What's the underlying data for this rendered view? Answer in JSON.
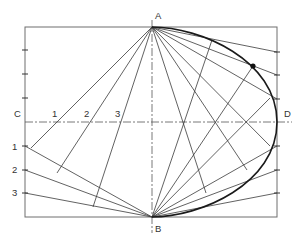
{
  "diagram": {
    "frame": {
      "x": 25,
      "y": 27,
      "width": 252,
      "height": 190
    },
    "center": {
      "x": 152,
      "y": 122
    },
    "labels": {
      "A": {
        "text": "A",
        "x": 155,
        "y": 19
      },
      "B": {
        "text": "B",
        "x": 155,
        "y": 232
      },
      "C": {
        "text": "C",
        "x": 14,
        "y": 117
      },
      "D": {
        "text": "D",
        "x": 284,
        "y": 117
      },
      "center_1": {
        "text": "1",
        "x": 52,
        "y": 117
      },
      "center_2": {
        "text": "2",
        "x": 84,
        "y": 117
      },
      "center_3": {
        "text": "3",
        "x": 115,
        "y": 117
      },
      "side_1": {
        "text": "1",
        "x": 12,
        "y": 150
      },
      "side_2": {
        "text": "2",
        "x": 12,
        "y": 173
      },
      "side_3": {
        "text": "3",
        "x": 12,
        "y": 196
      }
    },
    "points": {
      "A": [
        152,
        27
      ],
      "B": [
        152,
        217
      ],
      "center_divisions_left": [
        [
          57,
          122
        ],
        [
          88,
          122
        ],
        [
          120,
          122
        ]
      ],
      "center_divisions_right": [
        [
          183,
          122
        ],
        [
          215,
          122
        ],
        [
          246,
          122
        ]
      ],
      "left_ticks": [
        50,
        74,
        98,
        146,
        170,
        193
      ],
      "right_ticks": [
        52,
        75,
        99,
        146,
        170,
        193
      ],
      "highlighted_point": [
        253,
        66
      ]
    }
  }
}
